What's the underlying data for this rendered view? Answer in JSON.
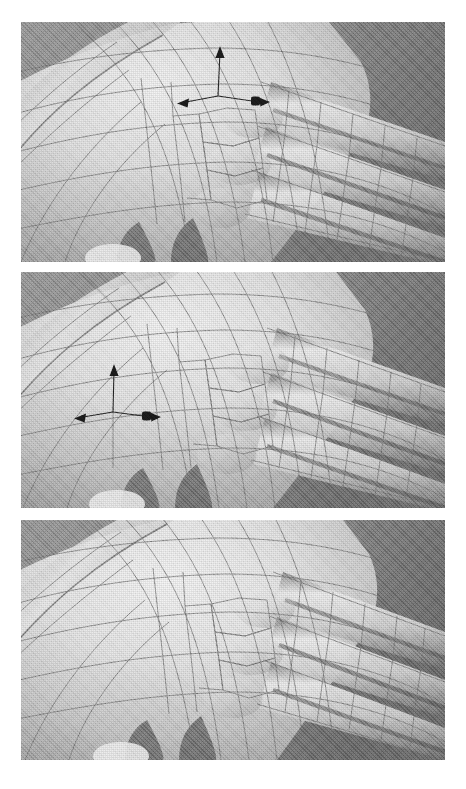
{
  "document": {
    "kind": "figure",
    "background_color": "#ffffff",
    "width": 466,
    "height": 789,
    "panel_count": 3
  },
  "viewport": {
    "background_color": "#8a8a8a",
    "model_color_light": "#f2f2f2",
    "model_color_mid": "#c9c9c9",
    "model_color_shadow": "#6e6e6e",
    "wireframe_color": "#7e7e7e",
    "subject": "hand-mesh"
  },
  "panels": [
    {
      "id": "panel-top",
      "label": "",
      "x": 21,
      "y": 22,
      "width": 424,
      "height": 240,
      "has_gizmo": true,
      "gizmo": {
        "name": "translate-manipulator",
        "x": 218,
        "y": 96,
        "color": "#1a1a1a",
        "axes": [
          {
            "name": "axis-y-up",
            "direction": "up",
            "length": 46,
            "handle": "cone"
          },
          {
            "name": "axis-x-left",
            "direction": "left",
            "length": 40,
            "handle": "cone"
          },
          {
            "name": "axis-x-right",
            "direction": "right",
            "length": 40,
            "handle": "cone-double"
          }
        ]
      }
    },
    {
      "id": "panel-middle",
      "label": "",
      "x": 21,
      "y": 272,
      "width": 424,
      "height": 236,
      "has_gizmo": true,
      "gizmo": {
        "name": "translate-manipulator",
        "x": 111,
        "y": 412,
        "color": "#1a1a1a",
        "axes": [
          {
            "name": "axis-y-up",
            "direction": "up",
            "length": 44,
            "handle": "cone"
          },
          {
            "name": "axis-x-left",
            "direction": "left",
            "length": 38,
            "handle": "cone"
          },
          {
            "name": "axis-x-right",
            "direction": "right",
            "length": 35,
            "handle": "cone-double"
          }
        ]
      }
    },
    {
      "id": "panel-bottom",
      "label": "",
      "x": 21,
      "y": 520,
      "width": 424,
      "height": 240,
      "has_gizmo": false,
      "gizmo": null
    }
  ]
}
